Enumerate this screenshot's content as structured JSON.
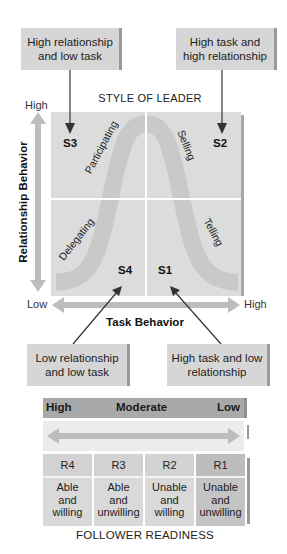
{
  "diagram": {
    "title": "STYLE OF LEADER",
    "callouts": {
      "top_left": "High relationship and low task",
      "top_right": "High task and high relationship",
      "bottom_left": "Low relationship and low task",
      "bottom_right": "High task and low relationship"
    },
    "quadrants": {
      "S1": "S1",
      "S2": "S2",
      "S3": "S3",
      "S4": "S4"
    },
    "styles": {
      "participating": "Participating",
      "selling": "Selling",
      "delegating": "Delegating",
      "telling": "Telling"
    },
    "y_axis": {
      "title": "Relationship Behavior",
      "high": "High",
      "low": "Low"
    },
    "x_axis": {
      "title": "Task Behavior",
      "low": "Low",
      "high": "High"
    },
    "readiness": {
      "scale_high": "High",
      "scale_moderate": "Moderate",
      "scale_low": "Low",
      "levels": [
        {
          "code": "R4",
          "line1": "Able",
          "line2": "and",
          "line3": "willing"
        },
        {
          "code": "R3",
          "line1": "Able",
          "line2": "and",
          "line3": "unwilling"
        },
        {
          "code": "R2",
          "line1": "Unable",
          "line2": "and",
          "line3": "willing"
        },
        {
          "code": "R1",
          "line1": "Unable",
          "line2": "and",
          "line3": "unwilling"
        }
      ],
      "title": "FOLLOWER READINESS"
    },
    "colors": {
      "panel_gray": "#d6d6d6",
      "quadrant_gray": "#dcdcdc",
      "curve_gray": "#cbcbcb",
      "arrow_gray": "#bdbdbd",
      "header_gray": "#a9a9a9",
      "r1_dark_gray": "#bdbdbd"
    }
  }
}
